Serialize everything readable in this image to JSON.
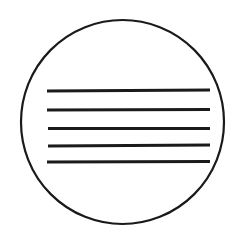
{
  "canvas": {
    "width": 244,
    "height": 231,
    "background_color": "#ffffff",
    "description": "Black outline circle containing five horizontal parallel lines"
  },
  "figure": {
    "ink_color": "#1a1a1a",
    "stroke_color": "#141414"
  },
  "shapes": {
    "circle": {
      "name": "outline-circle",
      "center_x": 122.5,
      "center_y": 122,
      "radius_x": 101.5,
      "radius_y": 102,
      "stroke_width": 2.2,
      "fill": "none",
      "stroke_color": "#1a1a1a"
    },
    "lines": [
      {
        "name": "horizontal-line-1",
        "index": 1,
        "x1": 47,
        "y1": 91,
        "x2": 210,
        "y2": 90,
        "stroke_width": 3.1,
        "stroke_color": "#1a1a1a"
      },
      {
        "name": "horizontal-line-2",
        "index": 2,
        "x1": 47,
        "y1": 110,
        "x2": 210,
        "y2": 109.5,
        "stroke_width": 3.0,
        "stroke_color": "#1a1a1a"
      },
      {
        "name": "horizontal-line-3",
        "index": 3,
        "x1": 48,
        "y1": 128.5,
        "x2": 210,
        "y2": 128.5,
        "stroke_width": 3.0,
        "stroke_color": "#1a1a1a"
      },
      {
        "name": "horizontal-line-4",
        "index": 4,
        "x1": 48,
        "y1": 146,
        "x2": 210,
        "y2": 145,
        "stroke_width": 3.0,
        "stroke_color": "#1a1a1a"
      },
      {
        "name": "horizontal-line-5",
        "index": 5,
        "x1": 47,
        "y1": 162,
        "x2": 210,
        "y2": 161.5,
        "stroke_width": 3.2,
        "stroke_color": "#1a1a1a"
      }
    ]
  }
}
